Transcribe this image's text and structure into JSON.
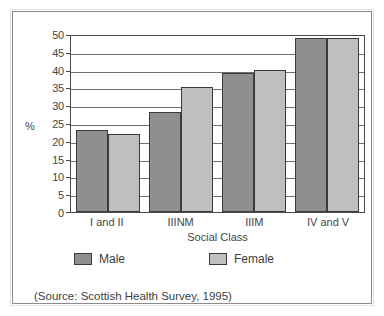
{
  "figure": {
    "source_note": "(Source: Scottish Health Survey, 1995)"
  },
  "legend": {
    "position": "below-axis",
    "entries": [
      {
        "label": "Male",
        "color": "#8f8f8f",
        "swatch_name": "legend-swatch-male"
      },
      {
        "label": "Female",
        "color": "#bfbfbf",
        "swatch_name": "legend-swatch-female"
      }
    ]
  },
  "chart_data": {
    "type": "bar",
    "title": "",
    "subtitle": "",
    "xlabel": "Social Class",
    "ylabel": "%",
    "categories": [
      "I and II",
      "IIINM",
      "IIIM",
      "IV and V"
    ],
    "series": [
      {
        "name": "Male",
        "color": "#8f8f8f",
        "values": [
          23,
          28,
          39,
          49
        ]
      },
      {
        "name": "Female",
        "color": "#bfbfbf",
        "values": [
          22,
          35,
          40,
          49
        ]
      }
    ],
    "ylim": [
      0,
      50
    ],
    "ytick_step": 5,
    "yticks": [
      0,
      5,
      10,
      15,
      20,
      25,
      30,
      35,
      40,
      45,
      50
    ],
    "ytick_labels": [
      "0",
      "5",
      "10",
      "15",
      "20",
      "25",
      "30",
      "35",
      "40",
      "45",
      "50"
    ],
    "grid": "horizontal",
    "legend_position": "bottom",
    "annotations": [
      "(Source: Scottish Health Survey, 1995)"
    ]
  }
}
